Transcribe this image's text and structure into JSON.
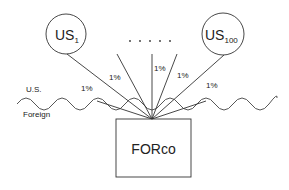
{
  "nodes": {
    "us1": {
      "label": "US",
      "subscript": "1"
    },
    "us100": {
      "label": "US",
      "subscript": "100"
    },
    "forco": {
      "label": "FORco"
    },
    "ellipsis": ". . . . ."
  },
  "regions": {
    "upper": "U.S.",
    "lower": "Foreign"
  },
  "edges": [
    {
      "label": "1%"
    },
    {
      "label": "1%"
    },
    {
      "label": "1%"
    },
    {
      "label": "1%"
    },
    {
      "label": "1%"
    }
  ],
  "colors": {
    "stroke": "#333333",
    "text": "#222222"
  }
}
